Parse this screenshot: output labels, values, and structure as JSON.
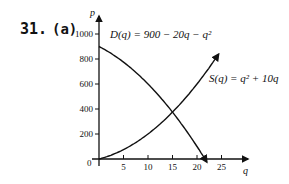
{
  "problem": {
    "number": "31.",
    "part": "(a)"
  },
  "chart_data": {
    "type": "line",
    "title": "",
    "xlabel": "q",
    "ylabel": "p",
    "xlim": [
      0,
      28
    ],
    "ylim": [
      0,
      1100
    ],
    "x_ticks": [
      "5",
      "10",
      "15",
      "20",
      "25"
    ],
    "y_ticks": [
      "200",
      "400",
      "600",
      "800",
      "1000"
    ],
    "origin_label": "0",
    "grid": false,
    "legend": "none (curves labeled inline)",
    "series": [
      {
        "name": "D(q) = 900 − 20q − q²",
        "label_text": "D(q) = 900 − 20q − q²",
        "x": [
          0,
          5,
          10,
          15,
          20,
          22
        ],
        "values": [
          900,
          775,
          600,
          375,
          100,
          0
        ]
      },
      {
        "name": "S(q) = q² + 10q",
        "label_text": "S(q) = q² + 10q",
        "x": [
          0,
          5,
          10,
          15,
          20,
          25
        ],
        "values": [
          0,
          75,
          200,
          375,
          600,
          875
        ]
      }
    ],
    "intersection": {
      "q": 15,
      "p": 375
    }
  }
}
